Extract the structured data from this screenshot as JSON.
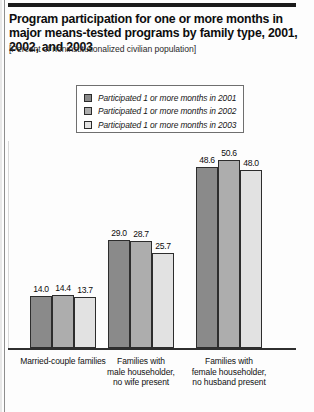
{
  "page": {
    "title": "Program participation for one or more months in major means-tested programs by family type, 2001, 2002, and 2003",
    "subtitle": "[Percent of noninstitutionalized civilian population]"
  },
  "legend": {
    "items": [
      {
        "label": "Participated 1 or more months in 2001",
        "color": "#8a8a8a"
      },
      {
        "label": "Participated 1 or more months in 2002",
        "color": "#adadad"
      },
      {
        "label": "Participated 1 or more months in 2003",
        "color": "#e2e2e2"
      }
    ]
  },
  "chart_data": {
    "type": "bar",
    "title": "Program participation for one or more months in major means-tested programs by family type, 2001, 2002, and 2003",
    "subtitle": "[Percent of noninstitutionalized civilian population]",
    "xlabel": "",
    "ylabel": "",
    "ylim": [
      0,
      56
    ],
    "grid": false,
    "legend_position": "top-center",
    "categories": [
      "Married-couple families",
      "Families with male householder, no wife present",
      "Families with female householder, no husband present"
    ],
    "category_lines": [
      [
        "Married-couple families"
      ],
      [
        "Families with",
        "male householder,",
        "no wife present"
      ],
      [
        "Families with",
        "female householder,",
        "no husband present"
      ]
    ],
    "series": [
      {
        "name": "Participated 1 or more months in 2001",
        "color": "#8a8a8a",
        "values": [
          14.0,
          29.0,
          48.6
        ],
        "labels": [
          "14.0",
          "29.0",
          "48.6"
        ]
      },
      {
        "name": "Participated 1 or more months in 2002",
        "color": "#adadad",
        "values": [
          14.4,
          28.7,
          50.6
        ],
        "labels": [
          "14.4",
          "28.7",
          "50.6"
        ]
      },
      {
        "name": "Participated 1 or more months in 2003",
        "color": "#e2e2e2",
        "values": [
          13.7,
          25.7,
          48.0
        ],
        "labels": [
          "13.7",
          "25.7",
          "48.0"
        ]
      }
    ]
  }
}
